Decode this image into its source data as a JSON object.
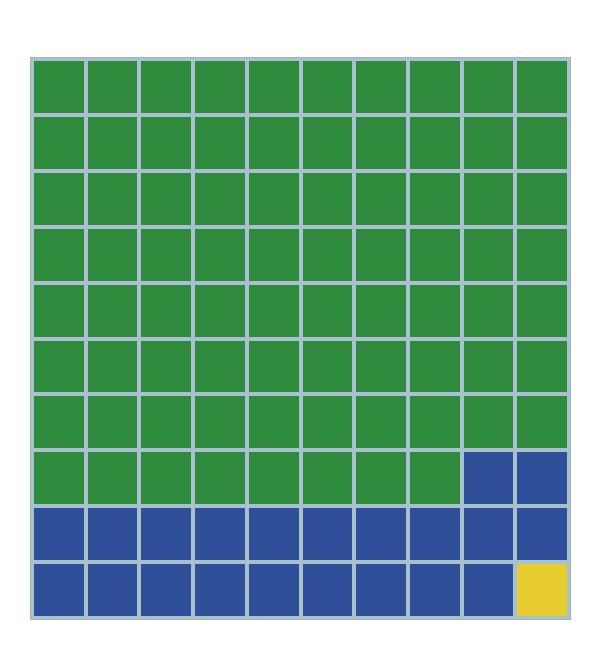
{
  "chart_data": {
    "type": "waffle",
    "title": "",
    "rows": 10,
    "cols": 10,
    "categories": [
      "Green",
      "Blue",
      "Yellow"
    ],
    "values": [
      78,
      21,
      1
    ],
    "colors": {
      "Green": "#2e8a3c",
      "Blue": "#2f4f99",
      "Yellow": "#e6cc2e"
    },
    "grid_line_color": "#a9c0cf",
    "fill_order": "row-major, top-left to bottom-right"
  }
}
